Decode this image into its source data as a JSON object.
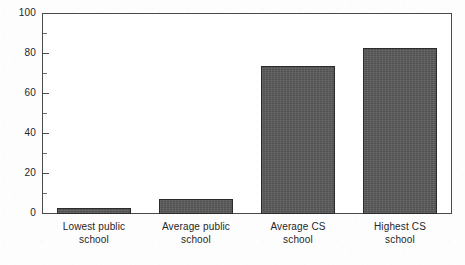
{
  "chart_data": {
    "type": "bar",
    "title": "",
    "subtitle": "",
    "xlabel": "",
    "ylabel": "",
    "categories": [
      "Lowest public school",
      "Average public school",
      "Average CS school",
      "Highest CS school"
    ],
    "category_lines": [
      [
        "Lowest public",
        "school"
      ],
      [
        "Average public",
        "school"
      ],
      [
        "Average CS",
        "school"
      ],
      [
        "Highest CS",
        "school"
      ]
    ],
    "values": [
      3,
      7.5,
      74,
      83
    ],
    "ylim": [
      0,
      100
    ],
    "ytick_labels": [
      "0",
      "20",
      "40",
      "60",
      "80",
      "100"
    ],
    "ytick_values": [
      0,
      20,
      40,
      60,
      80,
      100
    ],
    "yminor_values": [
      10,
      30,
      50,
      70,
      90
    ],
    "grid": false,
    "legend": null,
    "legend_position": "none",
    "annotations": [],
    "colors": {
      "bar_fill": "#585858",
      "bar_border": "#2b2b2b",
      "axis": "#4a4a4a",
      "text": "#262626",
      "plot_background": "#ffffff",
      "page_background": "#fdfdfd"
    }
  }
}
